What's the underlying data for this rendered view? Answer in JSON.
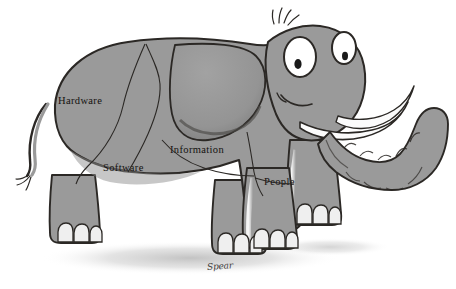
{
  "figure": {
    "background_color": "#ffffff",
    "body_color": "#9a9a9a",
    "body_shade_color": "#8b8b8b",
    "outline_color": "#2b2825",
    "nail_color": "#efefef",
    "tusk_color": "#fbfbfb",
    "eye_white_color": "#ffffff",
    "pupil_color": "#1a1a1a",
    "shadow_color": "#c9c9c9",
    "label_color": "#14110f"
  },
  "labels": {
    "hardware": "Hardware",
    "software": "Software",
    "information": "Information",
    "people": "People"
  },
  "signature": {
    "text": "Spear"
  },
  "regions": [
    {
      "id": "hardware",
      "label": "Hardware",
      "location": "rear upper body"
    },
    {
      "id": "software",
      "label": "Software",
      "location": "rear lower body"
    },
    {
      "id": "information",
      "label": "Information",
      "location": "mid body below ear"
    },
    {
      "id": "people",
      "label": "People",
      "location": "front shoulder"
    }
  ],
  "parts": [
    {
      "id": "tail",
      "name": "tail"
    },
    {
      "id": "ear",
      "name": "ear"
    },
    {
      "id": "eyes",
      "name": "eyes",
      "count": 2
    },
    {
      "id": "tusks",
      "name": "tusks",
      "count": 2
    },
    {
      "id": "trunk",
      "name": "trunk"
    },
    {
      "id": "hair",
      "name": "head-hair-tufts"
    },
    {
      "id": "feet",
      "name": "feet",
      "count": 4
    },
    {
      "id": "shadow",
      "name": "ground-shadow"
    }
  ]
}
